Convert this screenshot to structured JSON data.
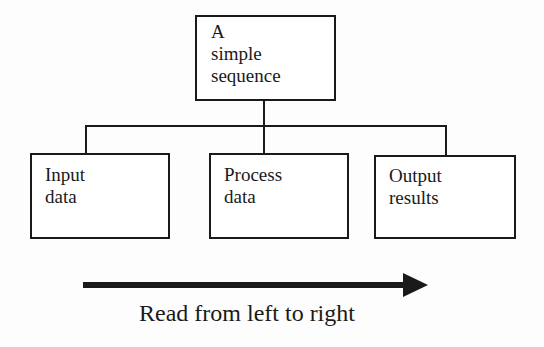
{
  "diagram": {
    "root": {
      "label_lines": [
        "A",
        "simple",
        "sequence"
      ]
    },
    "children": [
      {
        "label_lines": [
          "Input",
          "data"
        ]
      },
      {
        "label_lines": [
          "Process",
          "data"
        ]
      },
      {
        "label_lines": [
          "Output",
          "results"
        ]
      }
    ],
    "arrow": {
      "direction": "right",
      "caption": "Read from left to right"
    }
  },
  "colors": {
    "stroke": "#1a1a1a",
    "background": "#fdfdfd"
  }
}
